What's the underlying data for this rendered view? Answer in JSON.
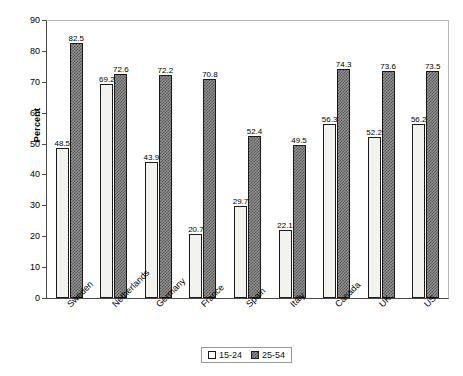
{
  "chart_data": {
    "type": "bar",
    "title": "",
    "xlabel": "",
    "ylabel": "Percent",
    "ylim": [
      0,
      90
    ],
    "ytick_step": 10,
    "yticks": [
      0,
      10,
      20,
      30,
      40,
      50,
      60,
      70,
      80,
      90
    ],
    "grid": false,
    "legend_position": "bottom-center",
    "categories": [
      "Sweden",
      "Netherlands",
      "Germany",
      "France",
      "Spain",
      "Italy",
      "Canada",
      "UK",
      "US"
    ],
    "series": [
      {
        "name": "15-24",
        "values": [
          48.5,
          69.2,
          43.9,
          20.7,
          29.7,
          22.1,
          56.3,
          52.2,
          56.2
        ]
      },
      {
        "name": "25-54",
        "values": [
          82.5,
          72.6,
          72.2,
          70.8,
          52.4,
          49.5,
          74.3,
          73.6,
          73.5
        ]
      }
    ]
  },
  "legend": {
    "items": [
      {
        "label": "15-24"
      },
      {
        "label": "25-54"
      }
    ]
  },
  "colors": {
    "series1_fill": "#f2f2ee",
    "series2_fill": "#8f8f8f",
    "bar_outline": "#1a1a1a",
    "axis": "#4a4a4a",
    "text": "#000000"
  }
}
